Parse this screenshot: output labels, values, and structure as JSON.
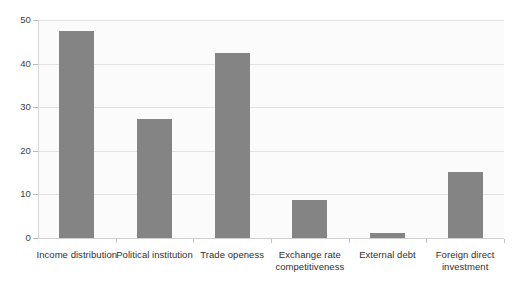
{
  "chart_data": {
    "type": "bar",
    "title": "",
    "subtitle": "",
    "xlabel": "",
    "ylabel": "",
    "categories": [
      "Income distribution",
      "Political institution",
      "Trade openess",
      "Exchange rate competitiveness",
      "External debt",
      "Foreign direct investment"
    ],
    "values": [
      47.5,
      27.2,
      42.4,
      8.7,
      1.1,
      15.2
    ],
    "ylim": [
      0,
      50
    ],
    "yticks": [
      0,
      10,
      20,
      30,
      40,
      50
    ],
    "ytick_labels": [
      "0",
      "10",
      "20",
      "30",
      "40",
      "50"
    ],
    "grid": true,
    "legend": "none",
    "bar_color": "#848484",
    "plot_background": "#fbfbfb",
    "gridline_color": "#e2e2e2",
    "axis_color": "#cfcfcf"
  }
}
